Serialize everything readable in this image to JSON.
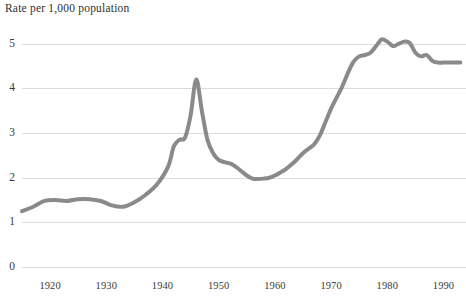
{
  "chart_data": {
    "type": "line",
    "title": "Rate per 1,000 population",
    "xlabel": "",
    "ylabel": "Rate per 1,000 population",
    "xlim": [
      1915,
      1994
    ],
    "ylim": [
      0,
      5.4
    ],
    "grid": true,
    "legend": "none",
    "yticks": [
      "0",
      "1",
      "2",
      "3",
      "4",
      "5"
    ],
    "ytick_values": [
      0,
      1,
      2,
      3,
      4,
      5
    ],
    "xticks": [
      "1920",
      "1930",
      "1940",
      "1950",
      "1960",
      "1970",
      "1980",
      "1990"
    ],
    "xtick_values": [
      1920,
      1930,
      1940,
      1950,
      1960,
      1970,
      1980,
      1990
    ],
    "line_color": "#808080",
    "grid_color": "#dcdcdc",
    "background_color": "#ffffff",
    "series": [
      {
        "name": "Rate per 1,000 population",
        "x": [
          1915,
          1917,
          1919,
          1921,
          1923,
          1925,
          1927,
          1929,
          1931,
          1933,
          1935,
          1937,
          1939,
          1941,
          1942,
          1943,
          1944,
          1945,
          1946,
          1947,
          1948,
          1949,
          1950,
          1951,
          1952,
          1953,
          1954,
          1955,
          1956,
          1957,
          1958,
          1959,
          1960,
          1961,
          1962,
          1963,
          1964,
          1965,
          1966,
          1967,
          1968,
          1969,
          1970,
          1971,
          1972,
          1973,
          1974,
          1975,
          1976,
          1977,
          1978,
          1979,
          1980,
          1981,
          1982,
          1983,
          1984,
          1985,
          1986,
          1987,
          1988,
          1989,
          1990,
          1991,
          1992,
          1993
        ],
        "values": [
          1.25,
          1.35,
          1.48,
          1.5,
          1.48,
          1.52,
          1.52,
          1.48,
          1.38,
          1.35,
          1.45,
          1.62,
          1.85,
          2.25,
          2.7,
          2.85,
          2.9,
          3.4,
          4.2,
          3.5,
          2.85,
          2.55,
          2.4,
          2.35,
          2.32,
          2.25,
          2.15,
          2.05,
          1.98,
          1.97,
          1.98,
          2.0,
          2.05,
          2.12,
          2.2,
          2.3,
          2.42,
          2.55,
          2.65,
          2.75,
          2.95,
          3.25,
          3.55,
          3.8,
          4.05,
          4.35,
          4.6,
          4.72,
          4.75,
          4.8,
          4.95,
          5.1,
          5.05,
          4.95,
          5.0,
          5.05,
          5.02,
          4.8,
          4.72,
          4.75,
          4.62,
          4.58,
          4.58,
          4.58,
          4.58,
          4.58
        ]
      }
    ]
  }
}
